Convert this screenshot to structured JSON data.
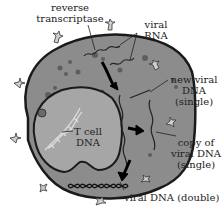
{
  "diagram": {
    "labels": {
      "reverse_transcriptase_1": "reverse",
      "reverse_transcriptase_2": "transcriptase",
      "viral_rna_1": "viral",
      "viral_rna_2": "RNA",
      "new_viral_dna_1": "new viral",
      "new_viral_dna_2": "DNA",
      "new_viral_dna_3": "(single)",
      "copy_viral_dna_1": "copy of",
      "copy_viral_dna_2": "viral DNA",
      "copy_viral_dna_3": "(single)",
      "t_cell_dna_1": "T cell",
      "t_cell_dna_2": "DNA",
      "viral_dna_double": "viral DNA (double)"
    },
    "colors": {
      "cytoplasm": "#8c8c8c",
      "nucleus": "#a6a6a6",
      "membrane": "#1a1a1a",
      "label_text": "#222222",
      "helix": "#dcdcdc",
      "arrow": "#000000"
    }
  }
}
